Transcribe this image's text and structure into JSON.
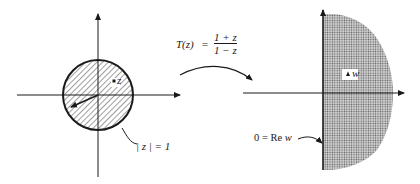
{
  "figure": {
    "left_plane": {
      "region": "unit disk (hatched)",
      "point_label": "z",
      "circle_label": "| z |  =  1"
    },
    "mapping": {
      "lhs": "T(z)",
      "equals": "=",
      "numerator": "1  +  z",
      "denominator": "1  −  z"
    },
    "right_plane": {
      "region": "right half-plane (stippled)",
      "point_label": "w",
      "boundary_label_prefix": "0  =  Re ",
      "boundary_label_var": "w"
    },
    "colors": {
      "ink": "#1a1a1a",
      "stipple": "#8a8a8a",
      "background": "#ffffff"
    }
  }
}
